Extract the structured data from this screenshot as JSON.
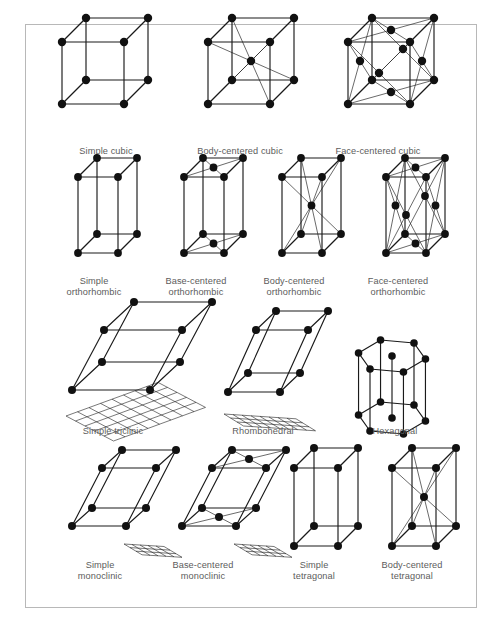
{
  "figure": {
    "type": "crystal-lattice-diagram",
    "frame": {
      "border_color": "#b8b8b8",
      "background": "#ffffff"
    },
    "label_color": "#5c5c5c",
    "node_color": "#111111",
    "edge_color": "#1a1a1a"
  },
  "rows": [
    {
      "name": "cubic",
      "cells": [
        {
          "id": "simple-cubic",
          "label": "Simple cubic",
          "shape": "cube",
          "centering": "simple"
        },
        {
          "id": "body-centered-cubic",
          "label": "Body-centered cubic",
          "shape": "cube",
          "centering": "body"
        },
        {
          "id": "face-centered-cubic",
          "label": "Face-centered cubic",
          "shape": "cube",
          "centering": "face"
        }
      ]
    },
    {
      "name": "orthorhombic",
      "cells": [
        {
          "id": "simple-orthorhombic",
          "label": "Simple\northorhombic",
          "shape": "prism",
          "centering": "simple"
        },
        {
          "id": "base-centered-orthorhombic",
          "label": "Base-centered\northorhombic",
          "shape": "prism",
          "centering": "base"
        },
        {
          "id": "body-centered-orthorhombic",
          "label": "Body-centered\northorhombic",
          "shape": "prism",
          "centering": "body"
        },
        {
          "id": "face-centered-orthorhombic",
          "label": "Face-centered\northorhombic",
          "shape": "prism",
          "centering": "face"
        }
      ]
    },
    {
      "name": "triclinic-rhombohedral-hexagonal",
      "cells": [
        {
          "id": "simple-triclinic",
          "label": "Simple triclinic",
          "shape": "triclinic",
          "centering": "simple"
        },
        {
          "id": "rhombohedral",
          "label": "Rhombohedral",
          "shape": "rhombohedron",
          "centering": "simple"
        },
        {
          "id": "hexagonal",
          "label": "Hexagonal",
          "shape": "hexagonal-prism",
          "centering": "simple"
        }
      ]
    },
    {
      "name": "monoclinic-tetragonal",
      "cells": [
        {
          "id": "simple-monoclinic",
          "label": "Simple\nmonoclinic",
          "shape": "monoclinic",
          "centering": "simple"
        },
        {
          "id": "base-centered-monoclinic",
          "label": "Base-centered\nmonoclinic",
          "shape": "monoclinic",
          "centering": "base"
        },
        {
          "id": "simple-tetragonal",
          "label": "Simple\ntetragonal",
          "shape": "prism",
          "centering": "simple"
        },
        {
          "id": "body-centered-tetragonal",
          "label": "Body-centered\ntetragonal",
          "shape": "prism",
          "centering": "body"
        }
      ]
    }
  ]
}
